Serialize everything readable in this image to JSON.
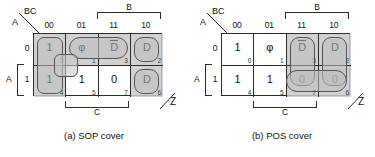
{
  "figure": {
    "maps": [
      {
        "id": "sop",
        "caption": "(a) SOP cover",
        "corner": {
          "top_label": "BC",
          "side_label": "A"
        },
        "output_label": "Z",
        "column_headers": [
          "00",
          "01",
          "11",
          "10"
        ],
        "row_headers": [
          "0",
          "1"
        ],
        "brackets": {
          "top": "B",
          "bottom": "C",
          "left": "A"
        },
        "cells": [
          {
            "value": "1",
            "index": "0",
            "overbar": false
          },
          {
            "value": "φ",
            "index": "1",
            "overbar": false
          },
          {
            "value": "D",
            "index": "3",
            "overbar": true
          },
          {
            "value": "D",
            "index": "2",
            "overbar": false
          },
          {
            "value": "1",
            "index": "4",
            "overbar": false
          },
          {
            "value": "1",
            "index": "5",
            "overbar": false
          },
          {
            "value": "0",
            "index": "7",
            "overbar": false
          },
          {
            "value": "D",
            "index": "6",
            "overbar": false
          }
        ]
      },
      {
        "id": "pos",
        "caption": "(b) POS cover",
        "corner": {
          "top_label": "BC",
          "side_label": "A"
        },
        "output_label": "Z",
        "column_headers": [
          "00",
          "01",
          "11",
          "10"
        ],
        "row_headers": [
          "0",
          "1"
        ],
        "brackets": {
          "top": "B",
          "bottom": "C",
          "left": "A"
        },
        "cells": [
          {
            "value": "1",
            "index": "0",
            "overbar": false
          },
          {
            "value": "φ",
            "index": "1",
            "overbar": false
          },
          {
            "value": "D",
            "index": "3",
            "overbar": true
          },
          {
            "value": "D",
            "index": "2",
            "overbar": false
          },
          {
            "value": "1",
            "index": "4",
            "overbar": false
          },
          {
            "value": "1",
            "index": "5",
            "overbar": false
          },
          {
            "value": "0",
            "index": "7",
            "overbar": false
          },
          {
            "value": "0",
            "index": "6",
            "overbar": false
          }
        ]
      }
    ],
    "colors": {
      "shade": "#c9c9c9",
      "line": "#2b2b2b",
      "group_outline": "#555555",
      "background": "#ffffff"
    }
  }
}
